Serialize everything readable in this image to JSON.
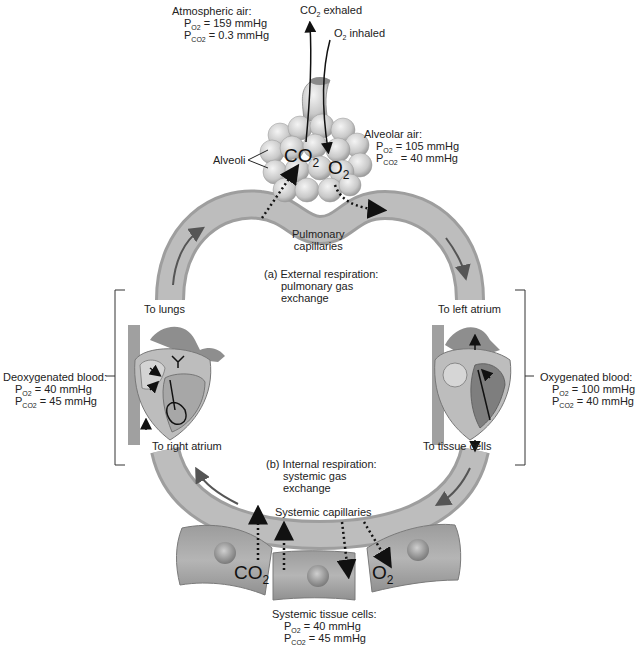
{
  "atmospheric": {
    "title": "Atmospheric air:",
    "po2_label": "P",
    "po2_sub": "O2",
    "po2_value": "= 159 mmHg",
    "pco2_label": "P",
    "pco2_sub": "CO2",
    "pco2_value": "= 0.3 mmHg"
  },
  "exhaled": {
    "prefix": "CO",
    "sub": "2",
    "suffix": " exhaled"
  },
  "inhaled": {
    "prefix": "O",
    "sub": "2",
    "suffix": " inhaled"
  },
  "alveoli_label": "Alveoli",
  "alveolar": {
    "title": "Alveolar air:",
    "po2_label": "P",
    "po2_sub": "O2",
    "po2_value": "= 105 mmHg",
    "pco2_label": "P",
    "pco2_sub": "CO2",
    "pco2_value": "= 40 mmHg"
  },
  "alveoli_gases": {
    "co2": "CO",
    "co2_sub": "2",
    "o2": "O",
    "o2_sub": "2"
  },
  "pulmonary_capillaries": {
    "line1": "Pulmonary",
    "line2": "capillaries"
  },
  "external_respiration": {
    "line1": "(a) External respiration:",
    "line2": "pulmonary gas",
    "line3": "exchange"
  },
  "to_lungs": "To lungs",
  "to_left_atrium": "To left atrium",
  "to_right_atrium": "To right atrium",
  "to_tissue_cells": "To tissue cells",
  "deoxygenated": {
    "title": "Deoxygenated blood:",
    "po2_label": "P",
    "po2_sub": "O2",
    "po2_value": "= 40 mmHg",
    "pco2_label": "P",
    "pco2_sub": "CO2",
    "pco2_value": "= 45 mmHg"
  },
  "oxygenated": {
    "title": "Oxygenated blood:",
    "po2_label": "P",
    "po2_sub": "O2",
    "po2_value": "= 100 mmHg",
    "pco2_label": "P",
    "pco2_sub": "CO2",
    "pco2_value": "= 40 mmHg"
  },
  "internal_respiration": {
    "line1": "(b) Internal respiration:",
    "line2": "systemic gas",
    "line3": "exchange"
  },
  "systemic_capillaries": "Systemic capillaries",
  "tissue_gases": {
    "co2": "CO",
    "co2_sub": "2",
    "o2": "O",
    "o2_sub": "2"
  },
  "systemic_tissue": {
    "title": "Systemic tissue cells:",
    "po2_label": "P",
    "po2_sub": "O2",
    "po2_value": "= 40 mmHg",
    "pco2_label": "P",
    "pco2_sub": "CO2",
    "pco2_value": "= 45 mmHg"
  },
  "colors": {
    "vessel": "#b9b9b9",
    "vessel_edge": "#9a9a9a",
    "cell": "#a8a8a8",
    "nucleus": "#8c8c8c",
    "text": "#222222"
  }
}
